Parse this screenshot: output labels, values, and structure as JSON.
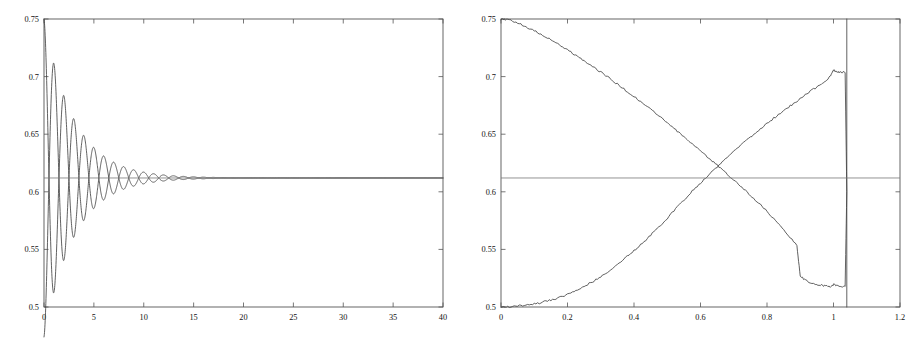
{
  "figure": {
    "background_color": "#ffffff",
    "axis_color": "#555555",
    "curve_color": "#444444",
    "reference_line_color": "#777777",
    "panel_count": 2
  },
  "chart_data": [
    {
      "type": "line",
      "panel": "left",
      "title": "",
      "subtitle": "",
      "xlabel": "",
      "ylabel": "",
      "grid": false,
      "legend": "none",
      "xlim": [
        0,
        40
      ],
      "ylim": [
        0.5,
        0.75
      ],
      "xticks": [
        0,
        5,
        10,
        15,
        20,
        25,
        30,
        35,
        40
      ],
      "xtick_labels": [
        "0",
        "5",
        "10",
        "15",
        "20",
        "25",
        "30",
        "35",
        "40"
      ],
      "yticks": [
        0.5,
        0.55,
        0.6,
        0.65,
        0.7,
        0.75
      ],
      "ytick_labels": [
        "0.5",
        "0.55",
        "0.6",
        "0.65",
        "0.7",
        "0.75"
      ],
      "annotations": [],
      "series": [
        {
          "name": "upper-start damped oscillation",
          "description": "starts at 0.75, oscillates about 0.612 with period 2 and decays",
          "start_value": 0.75,
          "limit_value": 0.612,
          "oscillation_period": 2.0,
          "initial_amplitude": 0.138,
          "decay_rate": 0.33,
          "phase": 0.0
        },
        {
          "name": "lower-start damped oscillation",
          "description": "starts at 0.5, oscillates about 0.612 in antiphase with period 2 and decays",
          "start_value": 0.5,
          "limit_value": 0.612,
          "oscillation_period": 2.0,
          "initial_amplitude": 0.138,
          "decay_rate": 0.33,
          "phase": 3.14159
        },
        {
          "name": "reference level",
          "description": "horizontal asymptote line",
          "kind": "horizontal-line",
          "value": 0.612
        }
      ]
    },
    {
      "type": "line",
      "panel": "right",
      "title": "",
      "subtitle": "",
      "xlabel": "",
      "ylabel": "",
      "grid": false,
      "legend": "none",
      "xlim": [
        0,
        1.2
      ],
      "ylim": [
        0.5,
        0.75
      ],
      "xticks": [
        0,
        0.2,
        0.4,
        0.6,
        0.8,
        1.0,
        1.2
      ],
      "xtick_labels": [
        "0",
        "0.2",
        "0.4",
        "0.6",
        "0.8",
        "1",
        "1.2"
      ],
      "yticks": [
        0.5,
        0.55,
        0.6,
        0.65,
        0.7,
        0.75
      ],
      "ytick_labels": [
        "0.5",
        "0.55",
        "0.6",
        "0.65",
        "0.7",
        "0.75"
      ],
      "crossing_point": [
        0.535,
        0.612
      ],
      "jump_x": 1.04,
      "annotations": [],
      "series": [
        {
          "name": "descending branch",
          "description": "decreases from 0.75 at x=0 to about 0.518 near x=1.0, slightly noisy, then jumps back to 0.75 at x=1.04",
          "x": [
            0,
            0.02,
            0.05,
            0.08,
            0.11,
            0.14,
            0.17,
            0.2,
            0.23,
            0.26,
            0.29,
            0.32,
            0.35,
            0.38,
            0.41,
            0.44,
            0.47,
            0.5,
            0.53,
            0.56,
            0.59,
            0.62,
            0.65,
            0.68,
            0.71,
            0.74,
            0.77,
            0.8,
            0.83,
            0.86,
            0.89,
            0.9,
            0.92,
            0.95,
            0.97,
            0.99,
            1.0,
            1.02,
            1.035,
            1.04,
            1.04
          ],
          "y": [
            0.75,
            0.7495,
            0.7465,
            0.7425,
            0.7385,
            0.7335,
            0.7285,
            0.7235,
            0.7175,
            0.712,
            0.706,
            0.7,
            0.6935,
            0.687,
            0.6805,
            0.674,
            0.667,
            0.66,
            0.6525,
            0.645,
            0.638,
            0.6305,
            0.623,
            0.6155,
            0.608,
            0.6,
            0.5915,
            0.583,
            0.5735,
            0.5635,
            0.5535,
            0.5265,
            0.5225,
            0.5195,
            0.5185,
            0.5175,
            0.5195,
            0.5175,
            0.5185,
            0.6,
            0.75
          ]
        },
        {
          "name": "ascending branch",
          "description": "increases from 0.5 at x=0 to about 0.706 near x=1.0, slightly noisy, then jumps down to 0.5 at x=1.04",
          "x": [
            0,
            0.02,
            0.05,
            0.08,
            0.11,
            0.14,
            0.17,
            0.2,
            0.23,
            0.26,
            0.29,
            0.32,
            0.35,
            0.38,
            0.41,
            0.44,
            0.47,
            0.5,
            0.53,
            0.56,
            0.59,
            0.62,
            0.65,
            0.68,
            0.71,
            0.74,
            0.77,
            0.8,
            0.83,
            0.86,
            0.89,
            0.92,
            0.95,
            0.97,
            0.99,
            1.0,
            1.01,
            1.02,
            1.035,
            1.04,
            1.04
          ],
          "y": [
            0.5,
            0.5002,
            0.5008,
            0.5018,
            0.5032,
            0.5052,
            0.5078,
            0.511,
            0.515,
            0.5195,
            0.5245,
            0.5305,
            0.537,
            0.544,
            0.5515,
            0.5595,
            0.568,
            0.577,
            0.5865,
            0.596,
            0.605,
            0.6135,
            0.6215,
            0.6295,
            0.6375,
            0.645,
            0.6525,
            0.6595,
            0.666,
            0.6725,
            0.6785,
            0.6855,
            0.691,
            0.695,
            0.7,
            0.7055,
            0.7045,
            0.7035,
            0.704,
            0.6,
            0.5
          ]
        },
        {
          "name": "reference level",
          "description": "horizontal asymptote line",
          "kind": "horizontal-line",
          "value": 0.612
        }
      ]
    }
  ]
}
